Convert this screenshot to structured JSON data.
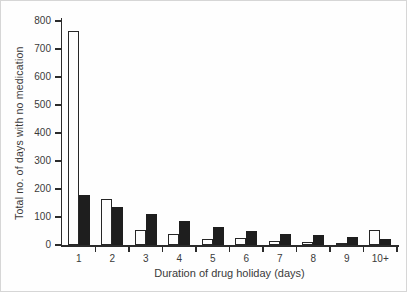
{
  "figure": {
    "background": "#fefefe",
    "frame_border_color": "#d6d6d6",
    "axis_color": "#2b2b2b"
  },
  "chart_data": {
    "type": "bar",
    "title": "",
    "xlabel": "Duration of drug holiday (days)",
    "ylabel": "Total no. of days with no medication",
    "categories": [
      "1",
      "2",
      "3",
      "4",
      "5",
      "6",
      "7",
      "8",
      "9",
      "10+"
    ],
    "series": [
      {
        "name": "open-white-bars",
        "fill": "#fdfdfd",
        "outline": "#262626",
        "values": [
          765,
          165,
          55,
          40,
          20,
          25,
          15,
          10,
          5,
          55
        ]
      },
      {
        "name": "solid-black-bars",
        "fill": "#1e1e1e",
        "outline": "#1e1e1e",
        "values": [
          180,
          135,
          110,
          85,
          65,
          50,
          40,
          35,
          30,
          20
        ]
      }
    ],
    "ylim": [
      0,
      800
    ],
    "ytick_step": 100,
    "yticks": [
      "0",
      "100",
      "200",
      "300",
      "400",
      "500",
      "600",
      "700",
      "800"
    ],
    "grid": false,
    "legend": "none"
  }
}
